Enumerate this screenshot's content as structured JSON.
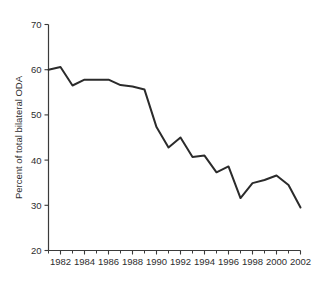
{
  "chart_data": {
    "type": "line",
    "title": "",
    "subtitle": "",
    "xlabel": "",
    "ylabel": "Percent of total bilateral ODA",
    "xlim": [
      1981,
      2002
    ],
    "ylim": [
      20,
      70
    ],
    "grid": false,
    "legend": null,
    "legend_position": "none",
    "line_color": "#2b2b2b",
    "axis_color": "#3b3b3b",
    "background_color": "#ffffff",
    "y_ticks": [
      20,
      30,
      40,
      50,
      60,
      70
    ],
    "y_tick_labels": [
      "20",
      "30",
      "40",
      "50",
      "60",
      "70"
    ],
    "x_ticks": [
      1982,
      1984,
      1986,
      1988,
      1990,
      1992,
      1994,
      1996,
      1998,
      2000,
      2002
    ],
    "x_tick_labels": [
      "1982",
      "1984",
      "1986",
      "1988",
      "1990",
      "1992",
      "1994",
      "1996",
      "1998",
      "2000",
      "2002"
    ],
    "x_minor_ticks": [
      1981,
      1983,
      1985,
      1987,
      1989,
      1991,
      1993,
      1995,
      1997,
      1999,
      2001
    ],
    "x": [
      1981,
      1982,
      1983,
      1984,
      1985,
      1986,
      1987,
      1988,
      1989,
      1990,
      1991,
      1992,
      1993,
      1994,
      1995,
      1996,
      1997,
      1998,
      1999,
      2000,
      2001,
      2002
    ],
    "values": [
      60.0,
      60.6,
      56.5,
      57.8,
      57.8,
      57.8,
      56.6,
      56.3,
      55.6,
      47.3,
      42.8,
      45.0,
      40.7,
      41.0,
      37.3,
      38.6,
      31.6,
      34.9,
      35.6,
      36.6,
      34.5,
      29.5
    ],
    "series": [
      {
        "name": "Percent of total bilateral ODA",
        "values": [
          60.0,
          60.6,
          56.5,
          57.8,
          57.8,
          57.8,
          56.6,
          56.3,
          55.6,
          47.3,
          42.8,
          45.0,
          40.7,
          41.0,
          37.3,
          38.6,
          31.6,
          34.9,
          35.6,
          36.6,
          34.5,
          29.5
        ]
      }
    ]
  }
}
